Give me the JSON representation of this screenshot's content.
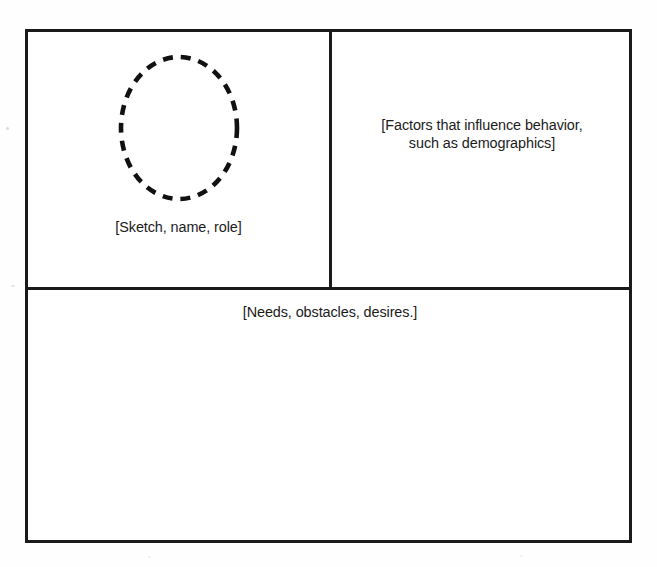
{
  "figure": {
    "kind": "persona-template",
    "background_color": "#fefefe",
    "line_color": "#1a1a1a",
    "text_color": "#1b1b1b"
  },
  "panels": {
    "sketch": {
      "name": "sketch-panel",
      "caption": "[Sketch, name, role]",
      "placeholder_icon": "dashed-ellipse-portrait-icon"
    },
    "demographics": {
      "name": "demographics-panel",
      "caption": "[Factors that influence behavior,\nsuch as demographics]"
    },
    "needs": {
      "name": "needs-panel",
      "caption": "[Needs, obstacles, desires.]"
    }
  }
}
